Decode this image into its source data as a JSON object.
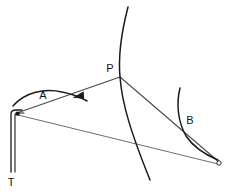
{
  "figure": {
    "background_color": "#ffffff",
    "width": 235,
    "height": 192
  },
  "colors": {
    "curve_stroke": "#1b1b1b",
    "line_stroke": "#4a4a4a",
    "thin_stroke": "#5c5c5c",
    "label_color": "#111111",
    "marker_fill": "#1b1b1b",
    "marker_hollow_fill": "#ffffff"
  },
  "labels": {
    "point_p": "P",
    "curve_a": "A",
    "curve_b": "B",
    "point_t": "T"
  },
  "geometry": {
    "point_p": {
      "x": 120,
      "y": 77
    },
    "point_t_corner": {
      "x": 15,
      "y": 112
    },
    "point_right_end": {
      "x": 220,
      "y": 163
    },
    "pole_bottom": {
      "x": 11,
      "y": 172
    },
    "main_curve": "M 128 7 C 122 30, 118 55, 120 77 C 122 105, 132 135, 150 180",
    "curve_a": "M 13 106 C 25 92, 45 88, 62 92 C 72 94, 80 97, 87 101",
    "curve_b": "M 180 88 C 176 104, 178 122, 186 136 C 194 148, 206 155, 218 160",
    "line_t_to_p": "M 17 113 L 120 77",
    "line_p_to_right": "M 120 77 L 219 162",
    "line_t_to_right": "M 18 115 L 218 164",
    "pole_outer": "M 11 172 L 11 114 C 11 111, 13 110, 16 110 L 22 110",
    "pole_inner": "M 15 172 L 15 115 C 15 113, 16 113, 18 113 L 24 113",
    "arrow_a": {
      "x": 78,
      "y": 94,
      "angle": -22
    }
  },
  "markers": {
    "corner_square": {
      "x": 17,
      "y": 113,
      "size": 3
    },
    "right_endpoint_circle": {
      "x": 219,
      "y": 163,
      "radius": 2.2
    }
  }
}
